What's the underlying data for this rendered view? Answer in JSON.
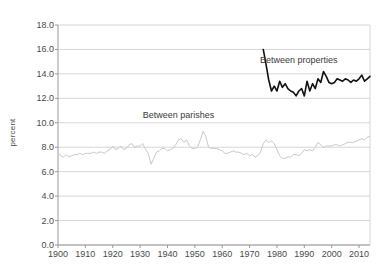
{
  "chart_data": {
    "type": "line",
    "title": "",
    "xlabel": "",
    "ylabel": "percent",
    "xlim": [
      1900,
      2014
    ],
    "ylim": [
      0.0,
      18.0
    ],
    "ytick_step": 2.0,
    "xtick_step": 10,
    "grid": "horizontal",
    "legend_position": "inline-annotations",
    "ytick_labels": [
      "0.0",
      "2.0",
      "4.0",
      "6.0",
      "8.0",
      "10.0",
      "12.0",
      "14.0",
      "16.0",
      "18.0"
    ],
    "ytick_values": [
      0.0,
      2.0,
      4.0,
      6.0,
      8.0,
      10.0,
      12.0,
      14.0,
      16.0,
      18.0
    ],
    "xtick_labels": [
      "1900",
      "1910",
      "1920",
      "1930",
      "1940",
      "1950",
      "1960",
      "1970",
      "1980",
      "1990",
      "2000",
      "2010"
    ],
    "xtick_values": [
      1900,
      1910,
      1920,
      1930,
      1940,
      1950,
      1960,
      1970,
      1980,
      1990,
      2000,
      2010
    ],
    "annotations": [
      {
        "name": "between-properties-label",
        "text": "Between properties",
        "x": 1988,
        "y": 15.1
      },
      {
        "name": "between-parishes-label",
        "text": "Between parishes",
        "x": 1944,
        "y": 10.6
      }
    ],
    "series": [
      {
        "name": "Between parishes",
        "color": "#c9c9c9",
        "width": 1,
        "x": [
          1900,
          1901,
          1902,
          1903,
          1904,
          1905,
          1906,
          1907,
          1908,
          1909,
          1910,
          1911,
          1912,
          1913,
          1914,
          1915,
          1916,
          1917,
          1918,
          1919,
          1920,
          1921,
          1922,
          1923,
          1924,
          1925,
          1926,
          1927,
          1928,
          1929,
          1930,
          1931,
          1932,
          1933,
          1934,
          1935,
          1936,
          1937,
          1938,
          1939,
          1940,
          1941,
          1942,
          1943,
          1944,
          1945,
          1946,
          1947,
          1948,
          1949,
          1950,
          1951,
          1952,
          1953,
          1954,
          1955,
          1956,
          1957,
          1958,
          1959,
          1960,
          1961,
          1962,
          1963,
          1964,
          1965,
          1966,
          1967,
          1968,
          1969,
          1970,
          1971,
          1972,
          1973,
          1974,
          1975,
          1976,
          1977,
          1978,
          1979,
          1980,
          1981,
          1982,
          1983,
          1984,
          1985,
          1986,
          1987,
          1988,
          1989,
          1990,
          1991,
          1992,
          1993,
          1994,
          1995,
          1996,
          1997,
          1998,
          1999,
          2000,
          2001,
          2002,
          2003,
          2004,
          2005,
          2006,
          2007,
          2008,
          2009,
          2010,
          2011,
          2012,
          2013,
          2014
        ],
        "values": [
          7.6,
          7.3,
          7.2,
          7.4,
          7.2,
          7.3,
          7.4,
          7.4,
          7.5,
          7.4,
          7.5,
          7.5,
          7.5,
          7.6,
          7.5,
          7.6,
          7.6,
          7.5,
          7.7,
          7.8,
          8.1,
          7.8,
          7.9,
          8.1,
          7.8,
          7.9,
          8.2,
          8.3,
          8.0,
          8.1,
          8.1,
          8.3,
          7.8,
          7.5,
          6.6,
          7.1,
          7.6,
          7.7,
          7.9,
          7.9,
          7.7,
          7.8,
          7.9,
          8.2,
          8.6,
          8.7,
          8.4,
          8.6,
          8.1,
          7.9,
          7.9,
          8.0,
          8.6,
          9.3,
          8.9,
          8.0,
          7.9,
          7.9,
          7.9,
          7.8,
          7.7,
          7.5,
          7.5,
          7.6,
          7.7,
          7.6,
          7.6,
          7.5,
          7.4,
          7.5,
          7.3,
          7.4,
          7.2,
          7.3,
          7.6,
          8.3,
          8.6,
          8.4,
          8.5,
          8.3,
          7.8,
          7.3,
          7.1,
          7.1,
          7.2,
          7.2,
          7.4,
          7.4,
          7.3,
          7.5,
          7.8,
          7.7,
          7.8,
          7.7,
          8.0,
          8.4,
          8.2,
          8.0,
          8.1,
          8.1,
          8.1,
          8.2,
          8.2,
          8.1,
          8.2,
          8.3,
          8.4,
          8.4,
          8.4,
          8.5,
          8.6,
          8.7,
          8.6,
          8.8,
          8.9
        ]
      },
      {
        "name": "Between properties",
        "color": "#111111",
        "width": 1.6,
        "x": [
          1975,
          1976,
          1977,
          1978,
          1979,
          1980,
          1981,
          1982,
          1983,
          1984,
          1985,
          1986,
          1987,
          1988,
          1989,
          1990,
          1991,
          1992,
          1993,
          1994,
          1995,
          1996,
          1997,
          1998,
          1999,
          2000,
          2001,
          2002,
          2003,
          2004,
          2005,
          2006,
          2007,
          2008,
          2009,
          2010,
          2011,
          2012,
          2013,
          2014
        ],
        "values": [
          16.0,
          14.8,
          13.5,
          12.6,
          13.0,
          12.6,
          13.4,
          12.9,
          13.2,
          12.8,
          12.6,
          12.5,
          12.2,
          12.6,
          12.8,
          12.2,
          13.4,
          12.6,
          13.2,
          12.8,
          13.6,
          13.3,
          14.2,
          13.8,
          13.3,
          13.2,
          13.3,
          13.6,
          13.5,
          13.4,
          13.6,
          13.5,
          13.3,
          13.5,
          13.4,
          13.6,
          13.9,
          13.4,
          13.6,
          13.8
        ]
      }
    ]
  },
  "axes": {
    "plot_left": 58,
    "plot_right": 370,
    "plot_top": 25,
    "plot_bottom": 245
  },
  "style": {
    "grid_color": "#d6d6d6",
    "axis_color": "#9a9a9a",
    "tick_text_color": "#4a4a4a",
    "background": "#ffffff"
  }
}
